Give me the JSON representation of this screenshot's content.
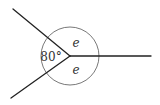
{
  "diagram": {
    "type": "angles-at-a-point",
    "center": {
      "x": 70,
      "y": 56
    },
    "circle_radius": 29,
    "rays": [
      {
        "name": "upper-left",
        "end": {
          "x": 13,
          "y": 9
        }
      },
      {
        "name": "lower-left",
        "end": {
          "x": 11,
          "y": 98
        }
      },
      {
        "name": "right",
        "end": {
          "x": 151,
          "y": 56
        }
      }
    ],
    "labels": {
      "known_angle": "80°",
      "upper_angle": "e",
      "lower_angle": "e"
    },
    "colors": {
      "line": "#222222",
      "circle": "#555555",
      "text": "#333333"
    }
  }
}
